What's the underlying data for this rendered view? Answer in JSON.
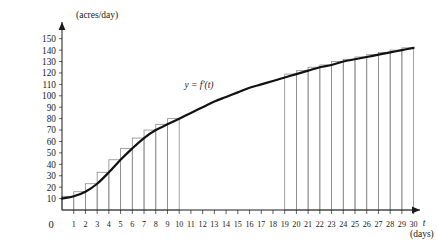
{
  "chart_data": {
    "type": "area",
    "title": "",
    "subtitle": "",
    "curve_label": "y = f'(t)",
    "xlabel": "t",
    "xlabel_unit": "(days)",
    "ylabel": "",
    "ylabel_unit": "(acres/day)",
    "origin_label": "0",
    "xlim": [
      0,
      30
    ],
    "ylim": [
      0,
      155
    ],
    "grid": false,
    "legend": false,
    "x_ticks": [
      1,
      2,
      3,
      4,
      5,
      6,
      7,
      8,
      9,
      10,
      11,
      12,
      13,
      14,
      15,
      16,
      17,
      18,
      19,
      20,
      21,
      22,
      23,
      24,
      25,
      26,
      27,
      28,
      29,
      30
    ],
    "y_ticks": [
      10,
      20,
      30,
      40,
      50,
      60,
      70,
      80,
      90,
      100,
      110,
      120,
      130,
      140,
      150
    ],
    "x": [
      0,
      1,
      2,
      3,
      4,
      5,
      6,
      7,
      8,
      9,
      10,
      11,
      12,
      13,
      14,
      15,
      16,
      17,
      18,
      19,
      20,
      21,
      22,
      23,
      24,
      25,
      26,
      27,
      28,
      29,
      30
    ],
    "values": [
      10,
      12,
      16,
      23,
      33,
      44,
      54,
      63,
      70,
      75,
      80,
      85,
      90,
      95,
      99,
      103,
      107,
      110,
      113,
      116,
      119,
      122,
      125,
      127,
      130,
      132,
      134,
      136,
      138,
      140,
      142
    ],
    "series": [
      {
        "name": "f'(t)",
        "values": [
          10,
          12,
          16,
          23,
          33,
          44,
          54,
          63,
          70,
          75,
          80,
          85,
          90,
          95,
          99,
          103,
          107,
          110,
          113,
          116,
          119,
          122,
          125,
          127,
          130,
          132,
          134,
          136,
          138,
          140,
          142
        ]
      }
    ],
    "rectangles_left": {
      "method": "right-endpoint",
      "interval": [
        0,
        10
      ],
      "x_start": [
        0,
        1,
        2,
        3,
        4,
        5,
        6,
        7,
        8,
        9
      ],
      "heights": [
        12,
        16,
        23,
        33,
        44,
        54,
        63,
        70,
        75,
        80
      ]
    },
    "rectangles_right": {
      "method": "right-endpoint",
      "interval": [
        19,
        30
      ],
      "x_start": [
        19,
        20,
        21,
        22,
        23,
        24,
        25,
        26,
        27,
        28,
        29
      ],
      "heights": [
        119,
        122,
        125,
        127,
        130,
        132,
        134,
        136,
        138,
        140,
        142
      ]
    }
  }
}
